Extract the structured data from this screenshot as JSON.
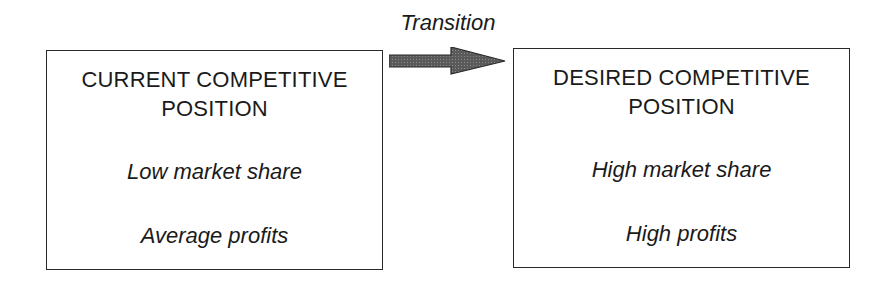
{
  "diagram": {
    "transition_label": "Transition",
    "arrow_color": "#555555",
    "current": {
      "title_line1": "CURRENT COMPETITIVE",
      "title_line2": "POSITION",
      "attribute1": "Low market share",
      "attribute2": "Average profits"
    },
    "desired": {
      "title_line1": "DESIRED COMPETITIVE",
      "title_line2": "POSITION",
      "attribute1": "High market share",
      "attribute2": "High profits"
    }
  }
}
